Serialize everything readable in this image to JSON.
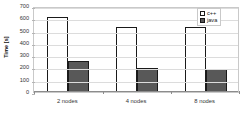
{
  "chart_data": {
    "type": "bar",
    "title": "",
    "subtitle": "",
    "xlabel": "",
    "ylabel": "Time [s]",
    "categories": [
      "2 nodes",
      "4 nodes",
      "8 nodes"
    ],
    "series": [
      {
        "name": "c++",
        "values": [
          610,
          530,
          530
        ],
        "color": "#ffffff"
      },
      {
        "name": "java",
        "values": [
          250,
          195,
          190
        ],
        "color": "#585858"
      }
    ],
    "ylim": [
      0,
      700
    ],
    "yticks": [
      0,
      100,
      200,
      300,
      400,
      500,
      600,
      700
    ],
    "ytick_labels": [
      "0",
      "100",
      "200",
      "300",
      "400",
      "500",
      "600",
      "700"
    ],
    "grid": true,
    "grid_axis": "y",
    "legend_position": "top-right",
    "legend_entries": [
      "c++",
      "java"
    ],
    "annotations": []
  },
  "axes": {
    "y_title": "Time [s]"
  },
  "legend": {
    "items": [
      {
        "label": "c++",
        "swatch": "legend-swatch-cpp"
      },
      {
        "label": "java",
        "swatch": "legend-swatch-java"
      }
    ]
  },
  "colors": {
    "cpp_fill": "#ffffff",
    "java_fill": "#585858",
    "bar_outline": "#1a1a1a",
    "gridline": "#dcdcdc",
    "plot_border": "#c9c9c9",
    "text": "#333333"
  }
}
